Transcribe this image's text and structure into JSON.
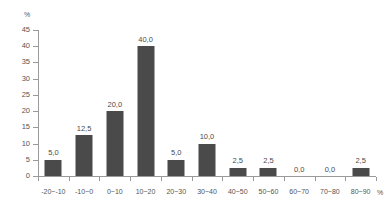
{
  "chart_data": {
    "type": "bar",
    "title": "",
    "subtitle": "",
    "xlabel": "%",
    "ylabel": "%",
    "categories": [
      "-20~-10",
      "-10~0",
      "0~10",
      "10~20",
      "20~30",
      "30~40",
      "40~50",
      "50~60",
      "60~70",
      "70~80",
      "80~90"
    ],
    "values": [
      5.0,
      12.5,
      20.0,
      40.0,
      5.0,
      10.0,
      2.5,
      2.5,
      0.0,
      0.0,
      2.5
    ],
    "value_labels": [
      "5,0",
      "12,5",
      "20,0",
      "40,0",
      "5,0",
      "10,0",
      "2,5",
      "2,5",
      "0,0",
      "0,0",
      "2,5"
    ],
    "ylim": [
      0,
      45
    ],
    "ytick_values": [
      0,
      5,
      10,
      15,
      20,
      25,
      30,
      35,
      40,
      45
    ],
    "ytick_labels": [
      "0",
      "5",
      "10",
      "15",
      "20",
      "25",
      "30",
      "35",
      "40",
      "45"
    ],
    "grid": false,
    "legend": false,
    "legend_position": "none",
    "bar_color": "#4a4a4a",
    "axis_color": "#9a9a9a",
    "text_color": "#555555",
    "background_color": "#ffffff"
  }
}
